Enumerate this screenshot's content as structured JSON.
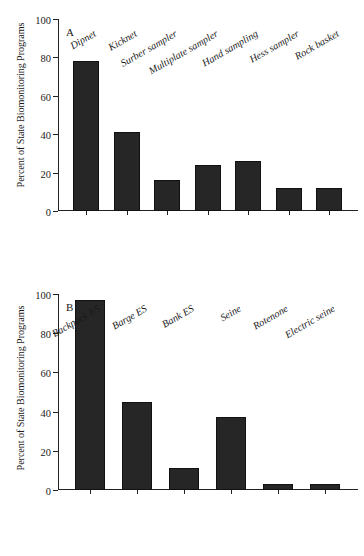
{
  "figure": {
    "background": "#ffffff",
    "bar_color": "#262626",
    "axis_color": "#222222"
  },
  "chart_data": [
    {
      "type": "bar",
      "panel_label": "A",
      "title": "",
      "xlabel": "",
      "ylabel": "Percent of State Biomonitoring Programs",
      "ylim": [
        0,
        100
      ],
      "yticks": [
        0,
        20,
        40,
        60,
        80,
        100
      ],
      "ytick_labels": [
        "0",
        "20",
        "40",
        "60",
        "80",
        "100"
      ],
      "grid": false,
      "legend": false,
      "categories": [
        "Dipnet",
        "Kicknet",
        "Surber sampler",
        "Multiplate sampler",
        "Hand sampling",
        "Hess sampler",
        "Rock basket"
      ],
      "values": [
        78,
        41,
        16,
        24,
        26,
        12,
        12
      ]
    },
    {
      "type": "bar",
      "panel_label": "B",
      "title": "",
      "xlabel": "",
      "ylabel": "Percent of State Biomonitoring Programs",
      "ylim": [
        0,
        100
      ],
      "yticks": [
        0,
        20,
        40,
        60,
        80,
        100
      ],
      "ytick_labels": [
        "0",
        "20",
        "40",
        "60",
        "80",
        "100"
      ],
      "grid": false,
      "legend": false,
      "categories": [
        "Backpack ES",
        "Barge ES",
        "Bank ES",
        "Seine",
        "Rotenone",
        "Electric seine"
      ],
      "values": [
        97,
        45,
        11,
        37,
        3,
        3
      ]
    }
  ]
}
